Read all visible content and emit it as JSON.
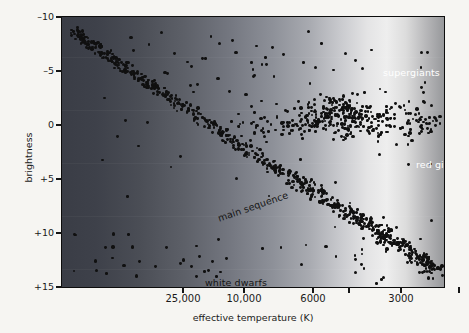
{
  "chart_data": {
    "type": "scatter",
    "title": "",
    "xlabel": "effective temperature (K)",
    "ylabel": "brightness",
    "x_scale": "log-reversed",
    "xticks": [
      {
        "label": "25,000",
        "value": 25000,
        "px": 121
      },
      {
        "label": "10,000",
        "value": 10000,
        "px": 182
      },
      {
        "label": "6000",
        "value": 6000,
        "px": 251
      },
      {
        "label": "3000",
        "value": 3000,
        "px": 339
      }
    ],
    "xtick_minor_px": [
      287,
      397
    ],
    "yticks": [
      "–10",
      "–5",
      "0",
      "+5",
      "+10",
      "+15"
    ],
    "ytick_values": [
      -10,
      -5,
      0,
      5,
      10,
      15
    ],
    "ylim": [
      -10,
      15
    ],
    "grid": false,
    "legend": "none",
    "annotations": [
      {
        "text": "supergiants",
        "color": "#ffffff",
        "rotation": 0,
        "region": "upper-right"
      },
      {
        "text": "red giants",
        "color": "#ffffff",
        "rotation": 0,
        "region": "mid-right"
      },
      {
        "text": "main sequence",
        "color": "#151515",
        "rotation": -19,
        "region": "center-diagonal"
      },
      {
        "text": "white dwarfs",
        "color": "#141414",
        "rotation": 0,
        "region": "lower-left"
      }
    ],
    "background": {
      "type": "horizontal-gradient",
      "description": "blue-grey at hot (left) brightening to near-white at cool (right)",
      "stops": [
        "#3a3d46",
        "#4a4d55",
        "#747780",
        "#a9abb1",
        "#e4e4e5",
        "#eeeeee",
        "#97989b"
      ]
    },
    "series": [
      {
        "name": "main sequence",
        "count": 520,
        "description": "dense diagonal band from hot/bright upper-left to cool/faint lower-right"
      },
      {
        "name": "red giants",
        "count": 190,
        "description": "clump near brightness 0 to -2 at 4500-3000 K"
      },
      {
        "name": "supergiants",
        "count": 34,
        "description": "sparse scatter across top at brightness -5 to -9"
      },
      {
        "name": "white dwarfs",
        "count": 30,
        "description": "sparse group at brightness +9 to +14, hot temperatures"
      }
    ]
  },
  "axes": {
    "y_title": "brightness",
    "x_title": "effective temperature (K)",
    "y_ticks": [
      "–10",
      "–5",
      "0",
      "+5",
      "+10",
      "+15"
    ],
    "x_ticks": [
      "25,000",
      "10,000",
      "6000",
      "3000"
    ]
  },
  "annotations": {
    "supergiants": "supergiants",
    "red_giants": "red giants",
    "main_sequence": "main sequence",
    "white_dwarfs": "white dwarfs"
  },
  "colors": {
    "page_background": "#f6f5f2",
    "axis_text": "#1a1a1a",
    "star_marker": "#101010",
    "light_annotation": "#ffffff",
    "dark_annotation": "#151515"
  }
}
